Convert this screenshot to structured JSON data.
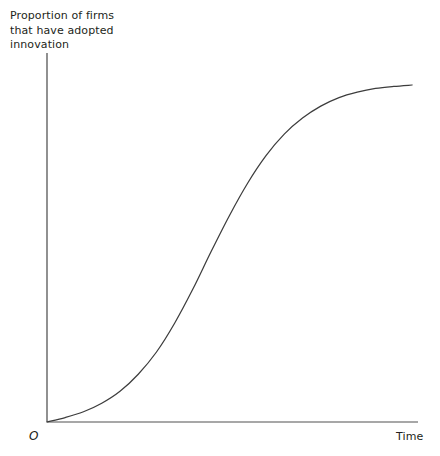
{
  "figure": {
    "width": 440,
    "height": 456,
    "background": "#ffffff"
  },
  "labels": {
    "y_axis_title": "Proportion of firms\nthat have adopted\ninnovation",
    "x_axis_title": "Time",
    "origin": "O"
  },
  "colors": {
    "curve": "#3d3d3d",
    "y_axis": "#555555",
    "x_axis": "#8a8a8a",
    "text": "#231f20",
    "background": "#ffffff"
  },
  "chart_data": {
    "type": "line",
    "title": "",
    "subtitle": "",
    "xlabel": "Time",
    "ylabel": "Proportion of firms that have adopted innovation",
    "origin_label": "O",
    "grid": false,
    "legend": false,
    "legend_position": "none",
    "axis_ticks": {
      "x": [],
      "y": []
    },
    "xlim": [
      0,
      1
    ],
    "ylim": [
      0,
      1
    ],
    "series": [
      {
        "name": "Cumulative adoption (S-curve)",
        "shape": "logistic sigmoid",
        "inflection_x": 0.49,
        "inflection_y": 0.5,
        "x": [
          0.0,
          0.05,
          0.1,
          0.15,
          0.2,
          0.25,
          0.3,
          0.35,
          0.4,
          0.45,
          0.5,
          0.55,
          0.6,
          0.65,
          0.7,
          0.75,
          0.8,
          0.85,
          0.9,
          0.95,
          1.0
        ],
        "y": [
          0.0,
          0.013,
          0.03,
          0.055,
          0.09,
          0.14,
          0.205,
          0.29,
          0.39,
          0.5,
          0.605,
          0.7,
          0.78,
          0.843,
          0.89,
          0.925,
          0.95,
          0.966,
          0.977,
          0.983,
          0.987
        ]
      }
    ],
    "annotations": []
  },
  "geometry": {
    "y_axis": {
      "x": 47,
      "y_top": 53,
      "y_bottom": 422
    },
    "x_axis": {
      "y": 422,
      "x_left": 47,
      "x_right": 418
    },
    "curve_path": "M47,422 C72,421.2 95,414 116,402 C140,388 160,372 178,352 C196,332 208,310 220,280 C232,250 243,222 256,198 C270,172 286,148 304,130 C322,112 342,98 364,91 C382,85.5 398,84.2 412,84.5"
  }
}
